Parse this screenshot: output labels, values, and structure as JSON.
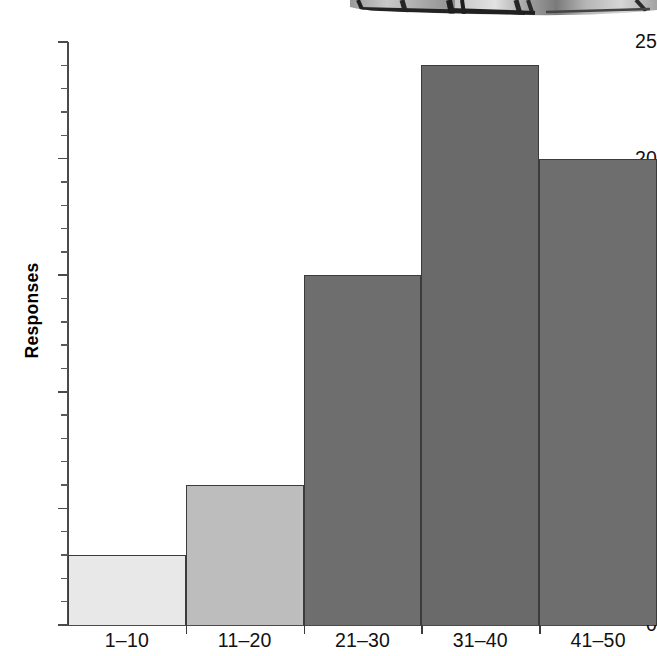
{
  "figure": {
    "photo_fragment_name": "cropped-photograph-bottom-edge"
  },
  "chart_data": {
    "type": "bar",
    "title": "",
    "subtitle": "",
    "xlabel": "",
    "ylabel": "Responses",
    "categories": [
      "1–10",
      "11–20",
      "21–30",
      "31–40",
      "41–50"
    ],
    "values": [
      3,
      6,
      15,
      24,
      20
    ],
    "series": [
      {
        "name": "Responses",
        "values": [
          3,
          6,
          15,
          24,
          20
        ]
      }
    ],
    "ylim": [
      0,
      25
    ],
    "y_tick_labels": [
      "0",
      "5",
      "10",
      "15",
      "20",
      "25"
    ],
    "y_tick_values": [
      0,
      5,
      10,
      15,
      20,
      25
    ],
    "y_minor_tick_interval": 1,
    "grid": false,
    "legend": "none",
    "bar_colors": [
      "#e8e8e8",
      "#bdbdbd",
      "#6e6e6e",
      "#6a6a6a",
      "#6e6e6e"
    ],
    "bar_edge_color": "#3b3b3b",
    "axis_color": "#4a4a4a",
    "text_color": "#111111",
    "background_color": "#ffffff",
    "bars_contiguous": true
  }
}
